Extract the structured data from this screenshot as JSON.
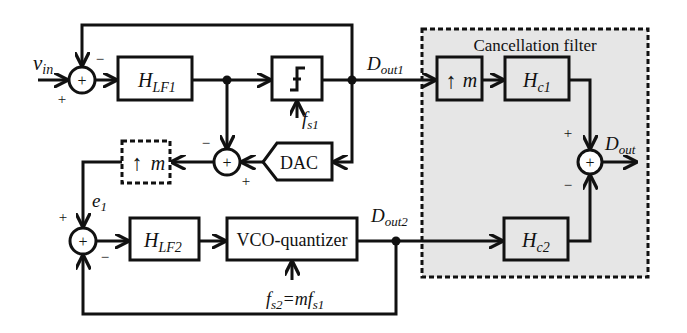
{
  "diagram": {
    "type": "block-diagram",
    "title": "",
    "colors": {
      "line": "#111111",
      "filter_background": "#e6e6e6",
      "background": "#ffffff"
    },
    "inputs": {
      "vin": {
        "main": "v",
        "sub": "in"
      }
    },
    "blocks": {
      "hlf1": {
        "main": "H",
        "sub": "LF1"
      },
      "quantizer": {
        "icon": "quantizer-step-icon"
      },
      "dac": {
        "label": "DAC"
      },
      "upsample_dashed": {
        "arrow": "↑",
        "label": "m"
      },
      "hlf2": {
        "main": "H",
        "sub": "LF2"
      },
      "vco": {
        "label": "VCO-quantizer"
      },
      "upsample_filter": {
        "arrow": "↑",
        "label": "m"
      },
      "hc1": {
        "main": "H",
        "sub": "c1"
      },
      "hc2": {
        "main": "H",
        "sub": "c2"
      }
    },
    "cancellation_filter": {
      "title": "Cancellation filter"
    },
    "signals": {
      "dout1": {
        "main": "D",
        "sub": "out1"
      },
      "dout2": {
        "main": "D",
        "sub": "out2"
      },
      "dout": {
        "main": "D",
        "sub": "out"
      },
      "e1": {
        "main": "e",
        "sub": "1"
      },
      "fs1": {
        "main": "f",
        "sub": "s1"
      },
      "fs2": {
        "main": "f",
        "sub": "s2",
        "eq": "=m",
        "main2": "f",
        "sub2": "s1"
      }
    },
    "summers": {
      "sum1": {
        "symbol": "+",
        "signs": [
          "−",
          "+"
        ]
      },
      "sum2": {
        "symbol": "+",
        "signs": [
          "−",
          "+"
        ]
      },
      "sum3": {
        "symbol": "+",
        "signs": [
          "+",
          "−"
        ]
      },
      "sum4": {
        "symbol": "+",
        "signs": [
          "+",
          "−"
        ]
      }
    }
  }
}
